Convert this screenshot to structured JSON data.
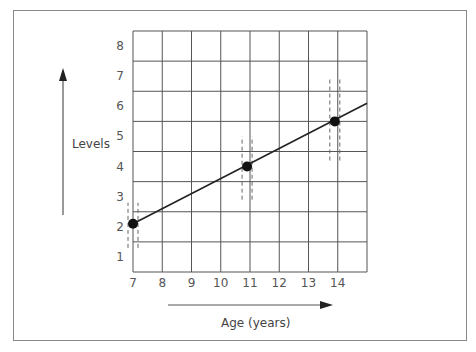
{
  "chart_data": {
    "type": "line",
    "title": "",
    "xlabel": "Age (years)",
    "ylabel": "Levels",
    "x_ticks": [
      "7",
      "8",
      "9",
      "10",
      "11",
      "12",
      "13",
      "14"
    ],
    "y_ticks": [
      "1",
      "2",
      "3",
      "4",
      "5",
      "6",
      "7",
      "8"
    ],
    "xlim": [
      7,
      15
    ],
    "ylim": [
      0.5,
      8.5
    ],
    "grid": true,
    "legend": null,
    "series": [
      {
        "name": "Levels trend",
        "points": [
          {
            "x": 7,
            "y": 2.1
          },
          {
            "x": 10.9,
            "y": 4.0
          },
          {
            "x": 13.9,
            "y": 5.5
          }
        ],
        "line": {
          "x_start": 7,
          "y_start": 2.1,
          "x_end": 15,
          "y_end": 6.1
        }
      }
    ],
    "annotations": [
      {
        "type": "dashed-error-band",
        "x": 7,
        "y_range": [
          1.3,
          2.8
        ]
      },
      {
        "type": "dashed-error-band",
        "x": 10.9,
        "y_range": [
          2.9,
          5.0
        ]
      },
      {
        "type": "dashed-error-band",
        "x": 13.9,
        "y_range": [
          4.2,
          6.9
        ]
      },
      {
        "type": "arrow",
        "direction": "up",
        "label": "Levels"
      },
      {
        "type": "arrow",
        "direction": "right",
        "label": "Age (years)"
      }
    ]
  },
  "labels": {
    "x_axis": "Age (years)",
    "y_axis": "Levels"
  }
}
